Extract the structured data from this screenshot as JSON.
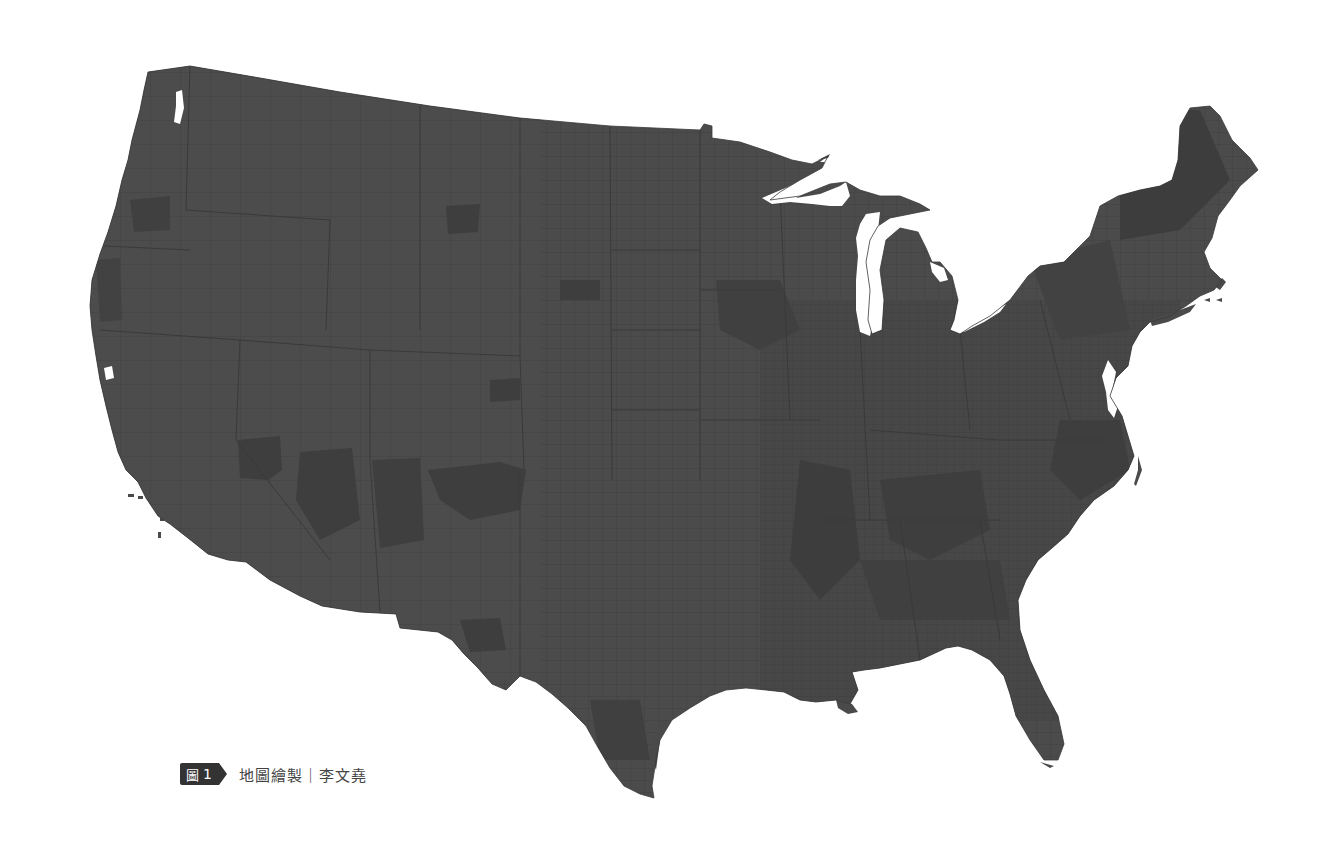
{
  "map": {
    "title": "Contiguous United States — county boundaries",
    "region": "Contiguous United States",
    "level": "county",
    "colors": {
      "background": "#ffffff",
      "land_fill": "#4a4a4a",
      "county_lines": "#3a3a3a",
      "darker_regions": "#3e3e3e",
      "water": "#ffffff"
    },
    "features": [
      "great-lakes-cutouts",
      "chesapeake-bay",
      "long-island",
      "cape-cod",
      "channel-islands",
      "florida-peninsula",
      "louisiana-delta"
    ]
  },
  "caption": {
    "figure_label": "圖",
    "figure_number": "1",
    "credit_text": "地圖繪製｜李文堯"
  }
}
